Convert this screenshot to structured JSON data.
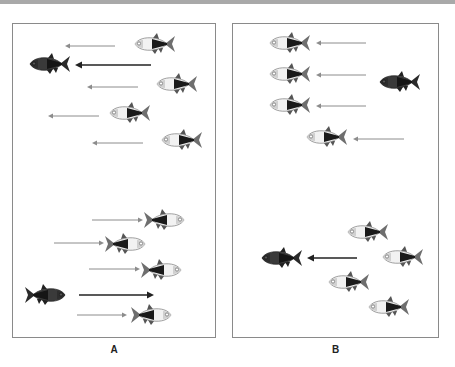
{
  "figure": {
    "panels": [
      {
        "id": "A",
        "label": "A",
        "description": "Predator fish leads; prey fish move in the same direction",
        "box": {
          "x": 12,
          "y": 23,
          "w": 204,
          "h": 315
        },
        "fish": [
          {
            "x": 150,
            "y": 43,
            "dir": "left",
            "type": "light"
          },
          {
            "x": 45,
            "y": 63,
            "dir": "left",
            "type": "dark"
          },
          {
            "x": 172,
            "y": 83,
            "dir": "left",
            "type": "light"
          },
          {
            "x": 125,
            "y": 112,
            "dir": "left",
            "type": "light"
          },
          {
            "x": 177,
            "y": 139,
            "dir": "left",
            "type": "light"
          },
          {
            "x": 167,
            "y": 219,
            "dir": "right",
            "type": "light"
          },
          {
            "x": 128,
            "y": 243,
            "dir": "right",
            "type": "light"
          },
          {
            "x": 164,
            "y": 269,
            "dir": "right",
            "type": "light"
          },
          {
            "x": 48,
            "y": 294,
            "dir": "right",
            "type": "dark"
          },
          {
            "x": 154,
            "y": 314,
            "dir": "right",
            "type": "light"
          }
        ],
        "arrows": [
          {
            "x1": 114,
            "y1": 45,
            "x2": 64,
            "y2": 45,
            "bold": false
          },
          {
            "x1": 150,
            "y1": 64,
            "x2": 74,
            "y2": 64,
            "bold": true
          },
          {
            "x1": 137,
            "y1": 86,
            "x2": 86,
            "y2": 86,
            "bold": false
          },
          {
            "x1": 98,
            "y1": 115,
            "x2": 47,
            "y2": 115,
            "bold": false
          },
          {
            "x1": 142,
            "y1": 142,
            "x2": 91,
            "y2": 142,
            "bold": false
          },
          {
            "x1": 91,
            "y1": 219,
            "x2": 142,
            "y2": 219,
            "bold": false
          },
          {
            "x1": 53,
            "y1": 242,
            "x2": 103,
            "y2": 242,
            "bold": false
          },
          {
            "x1": 88,
            "y1": 268,
            "x2": 139,
            "y2": 268,
            "bold": false
          },
          {
            "x1": 78,
            "y1": 294,
            "x2": 153,
            "y2": 294,
            "bold": true
          },
          {
            "x1": 76,
            "y1": 314,
            "x2": 126,
            "y2": 314,
            "bold": false
          }
        ]
      },
      {
        "id": "B",
        "label": "B",
        "description": "Predator fish is separated from prey group",
        "box": {
          "x": 232,
          "y": 23,
          "w": 207,
          "h": 315
        },
        "fish": [
          {
            "x": 285,
            "y": 42,
            "dir": "left",
            "type": "light"
          },
          {
            "x": 285,
            "y": 73,
            "dir": "left",
            "type": "light"
          },
          {
            "x": 395,
            "y": 81,
            "dir": "left",
            "type": "dark"
          },
          {
            "x": 285,
            "y": 104,
            "dir": "left",
            "type": "light"
          },
          {
            "x": 322,
            "y": 136,
            "dir": "left",
            "type": "light"
          },
          {
            "x": 363,
            "y": 231,
            "dir": "left",
            "type": "light"
          },
          {
            "x": 277,
            "y": 257,
            "dir": "left",
            "type": "dark"
          },
          {
            "x": 398,
            "y": 256,
            "dir": "left",
            "type": "light"
          },
          {
            "x": 344,
            "y": 281,
            "dir": "left",
            "type": "light"
          },
          {
            "x": 384,
            "y": 306,
            "dir": "left",
            "type": "light"
          }
        ],
        "arrows": [
          {
            "x1": 365,
            "y1": 42,
            "x2": 315,
            "y2": 42,
            "bold": false
          },
          {
            "x1": 365,
            "y1": 74,
            "x2": 315,
            "y2": 74,
            "bold": false
          },
          {
            "x1": 365,
            "y1": 105,
            "x2": 315,
            "y2": 105,
            "bold": false
          },
          {
            "x1": 403,
            "y1": 138,
            "x2": 352,
            "y2": 138,
            "bold": false
          },
          {
            "x1": 356,
            "y1": 257,
            "x2": 306,
            "y2": 257,
            "bold": true
          }
        ]
      }
    ]
  },
  "colors": {
    "border": "#8a8a8a",
    "arrow_light": "#8c8c8c",
    "arrow_bold": "#222222",
    "fish_light_body": "#f2f2f2",
    "fish_dark_body": "#3a3a3a",
    "fish_fin": "#555555"
  }
}
